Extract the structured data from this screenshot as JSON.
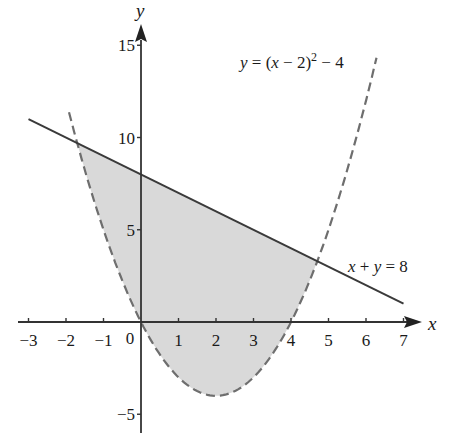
{
  "chart_data": {
    "type": "line",
    "title": "",
    "xlabel": "x",
    "ylabel": "y",
    "xlim": [
      -3,
      7
    ],
    "ylim": [
      -5,
      15
    ],
    "grid": false,
    "x_ticks": [
      -3,
      -2,
      -1,
      0,
      1,
      2,
      3,
      4,
      5,
      6,
      7
    ],
    "x_tick_labels": [
      "−3",
      "−2",
      "−1",
      "0",
      "1",
      "2",
      "3",
      "4",
      "5",
      "6",
      "7"
    ],
    "y_ticks": [
      -5,
      5,
      10,
      15
    ],
    "y_tick_labels": [
      "−5",
      "5",
      "10",
      "15"
    ],
    "series": [
      {
        "name": "y = (x − 2)² − 4",
        "style": "dashed",
        "color": "#6e6e6e",
        "x": [
          -1.6,
          -1,
          0,
          1,
          2,
          3,
          4,
          5,
          6,
          6.8
        ],
        "y": [
          8.96,
          5,
          0,
          -3,
          -4,
          -3,
          0,
          5,
          12,
          19.04
        ]
      },
      {
        "name": "x + y = 8",
        "style": "solid",
        "color": "#3a3a3a",
        "x": [
          -3,
          7
        ],
        "y": [
          11,
          1
        ]
      }
    ],
    "shaded_region": {
      "description": "Region above the parabola y=(x-2)^2-4 and below the line x+y=8",
      "fill": "#d9d9d9",
      "x_range": [
        -1.7,
        4.7
      ],
      "intersections": [
        [
          -1.7,
          9.7
        ],
        [
          4.7,
          3.3
        ]
      ]
    },
    "annotations": [
      {
        "text": "y = (x − 2)² − 4",
        "x": 4.0,
        "y": 14.1
      },
      {
        "text": "x + y = 8",
        "x": 5.8,
        "y": 3.0
      }
    ]
  },
  "labels": {
    "x_axis": "x",
    "y_axis": "y",
    "origin": "0",
    "parabola_eq": {
      "lhs": "y",
      "eq": " = (",
      "var": "x",
      "rest": " − 2)",
      "exp": "2",
      "tail": " − 4"
    },
    "line_eq": {
      "a": "x",
      "plus": " + ",
      "b": "y",
      "rest": " = 8"
    }
  }
}
